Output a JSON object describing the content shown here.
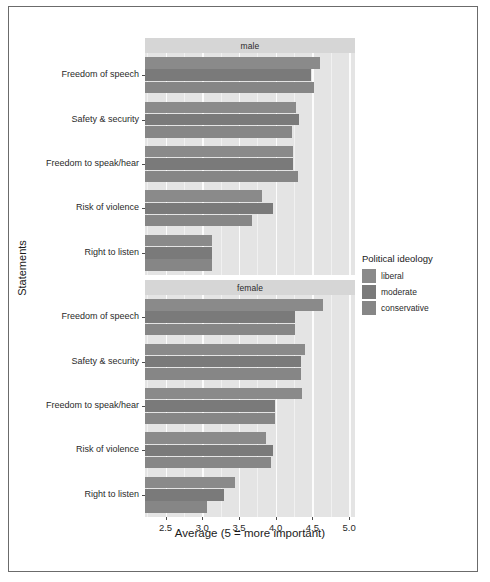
{
  "chart_data": {
    "type": "bar",
    "orientation": "horizontal",
    "title": "",
    "xlabel": "Average (5 = more important)",
    "ylabel": "Statements",
    "xlim": [
      2.22,
      5.08
    ],
    "xticks": [
      2.5,
      3.0,
      3.5,
      4.0,
      4.5,
      5.0
    ],
    "xticklabels": [
      "2.5",
      "3.0",
      "3.5",
      "4.0",
      "4.5",
      "5.0"
    ],
    "grid": true,
    "grid_minor": true,
    "legend_title": "Political ideology",
    "legend_position": "right",
    "legend_entries": [
      "liberal",
      "moderate",
      "conservative"
    ],
    "facet_variable": "sex",
    "facets": [
      "male",
      "female"
    ],
    "categories": [
      "Freedom of speech",
      "Safety & security",
      "Freedom to speak/hear",
      "Risk of violence",
      "Right to listen"
    ],
    "panels": [
      {
        "facet": "male",
        "series": [
          {
            "name": "liberal",
            "values": [
              4.61,
              4.27,
              4.24,
              3.81,
              3.13
            ]
          },
          {
            "name": "moderate",
            "values": [
              4.48,
              4.32,
              4.24,
              3.96,
              3.13
            ]
          },
          {
            "name": "conservative",
            "values": [
              4.52,
              4.22,
              4.3,
              3.68,
              3.13
            ]
          }
        ]
      },
      {
        "facet": "female",
        "series": [
          {
            "name": "liberal",
            "values": [
              4.64,
              4.4,
              4.36,
              3.87,
              3.44
            ]
          },
          {
            "name": "moderate",
            "values": [
              4.26,
              4.35,
              3.99,
              3.97,
              3.29
            ]
          },
          {
            "name": "conservative",
            "values": [
              4.26,
              4.35,
              3.99,
              3.93,
              3.07
            ]
          }
        ]
      }
    ],
    "colors": {
      "liberal": "#8a8a8a",
      "moderate": "#7a7a7a",
      "conservative": "#868686",
      "panel_background": "#e4e4e4",
      "strip_background": "#d6d6d6",
      "gridline": "#fcfcfc",
      "frame_border": "#6b6b6b"
    }
  },
  "axes": {
    "y_title": "Statements",
    "x_title": "Average (5 = more important)"
  },
  "legend": {
    "title": "Political ideology",
    "items": [
      {
        "label": "liberal",
        "color": "#8a8a8a"
      },
      {
        "label": "moderate",
        "color": "#7a7a7a"
      },
      {
        "label": "conservative",
        "color": "#868686"
      }
    ]
  },
  "strips": {
    "male": "male",
    "female": "female"
  }
}
